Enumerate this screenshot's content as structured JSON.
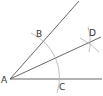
{
  "diagram": {
    "type": "angle-bisector-construction",
    "colors": {
      "ray": "#555555",
      "arc": "#b0b0b0",
      "label": "#333333"
    },
    "points": {
      "A": {
        "label": "A",
        "x": 10,
        "y": 79,
        "lx": 1,
        "ly": 83
      },
      "B": {
        "label": "B",
        "x": 42,
        "y": 40,
        "lx": 36,
        "ly": 37
      },
      "C": {
        "label": "C",
        "x": 58,
        "y": 79,
        "lx": 59,
        "ly": 89
      },
      "D": {
        "label": "D",
        "x": 90,
        "y": 41,
        "lx": 90,
        "ly": 36
      }
    },
    "rays": [
      {
        "name": "ray-AB",
        "from": "A",
        "to": [
          79,
          1
        ]
      },
      {
        "name": "ray-AD",
        "from": "A",
        "to": [
          101,
          37
        ]
      },
      {
        "name": "ray-AC",
        "from": "A",
        "to": [
          102,
          79
        ]
      }
    ]
  }
}
